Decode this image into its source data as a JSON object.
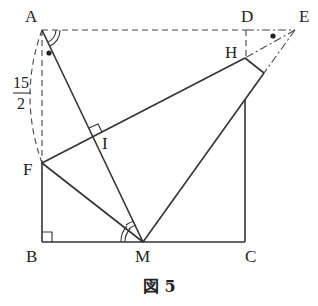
{
  "figure": {
    "caption": "図 5",
    "points": {
      "A": {
        "label": "A",
        "x": 42,
        "y": 30
      },
      "D": {
        "label": "D",
        "x": 246,
        "y": 30
      },
      "E": {
        "label": "E",
        "x": 295,
        "y": 30
      },
      "H": {
        "label": "H",
        "x": 245,
        "y": 58
      },
      "G": {
        "label": "",
        "x": 264,
        "y": 73
      },
      "I": {
        "label": "I",
        "x": 93,
        "y": 137
      },
      "F": {
        "label": "F",
        "x": 42,
        "y": 163
      },
      "B": {
        "label": "B",
        "x": 42,
        "y": 242
      },
      "M": {
        "label": "M",
        "x": 143,
        "y": 242
      },
      "C": {
        "label": "C",
        "x": 245,
        "y": 242
      }
    },
    "length_annotation": {
      "numerator": "15",
      "denominator": "2",
      "segment": "AF"
    },
    "marks": {
      "right_angles": [
        "B",
        "I"
      ],
      "equal_double_arcs": [
        "A (angle DAM)",
        "M (angle FMA)"
      ],
      "dots": [
        "A (angle FAM)",
        "E (angle DEH)"
      ]
    }
  }
}
